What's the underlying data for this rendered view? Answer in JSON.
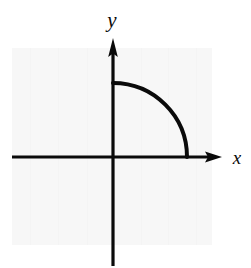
{
  "figure": {
    "canvas": {
      "width": 251,
      "height": 268
    },
    "background_color": "#ffffff",
    "panel": {
      "name": "plot-panel",
      "fill_color": "#f7f7f7",
      "x": 12,
      "y": 48,
      "width": 200,
      "height": 197
    },
    "ink_color": "#0a0a0a"
  },
  "axes": {
    "origin": {
      "x": 113,
      "y": 157
    },
    "x_axis": {
      "label": "x",
      "label_x": 237,
      "label_y": 163,
      "start_x": 12,
      "end_x": 222,
      "y": 157,
      "stroke_width": 3,
      "arrow": "right"
    },
    "y_axis": {
      "label": "y",
      "label_x": 112,
      "label_y": 27,
      "x": 113,
      "start_y": 266,
      "end_y": 38,
      "stroke_width": 3,
      "arrow": "up"
    }
  },
  "chart_data": {
    "type": "line",
    "xlabel": "x",
    "ylabel": "y",
    "grid": false,
    "legend": null,
    "annotations": [],
    "series": [
      {
        "name": "quarter-circle-arc",
        "shape": "circular-arc",
        "radius_px": 74,
        "center": {
          "x": 0,
          "y": 0
        },
        "start_point": {
          "x": 0,
          "y": 74
        },
        "end_point": {
          "x": 74,
          "y": 0
        },
        "start_angle_deg": 90,
        "end_angle_deg": 0,
        "stroke_color": "#0a0a0a",
        "stroke_width": 4,
        "quadrant": 1
      }
    ],
    "xlim": [
      -101,
      109
    ],
    "ylim": [
      -109,
      119
    ]
  }
}
